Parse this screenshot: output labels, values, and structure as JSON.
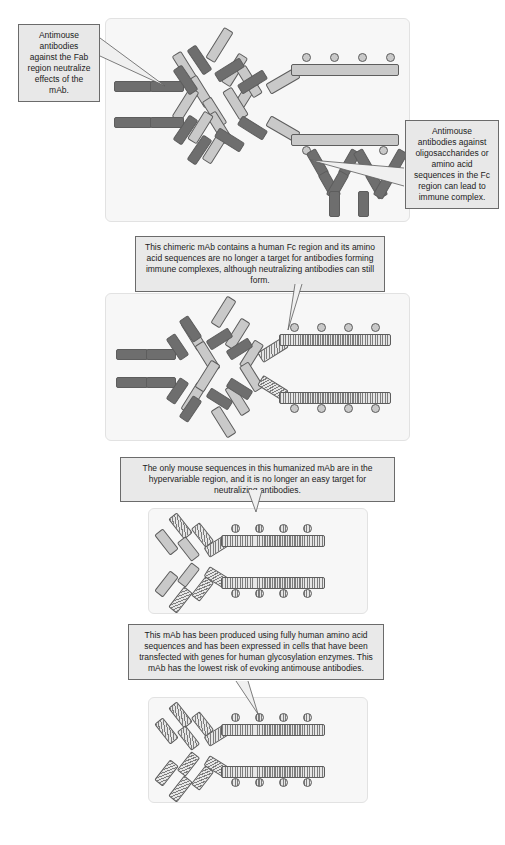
{
  "figure": {
    "kind": "antibody-immunogenicity-diagram",
    "panel_count": 4
  },
  "callouts": [
    {
      "id": "fab-neutralize",
      "text": "Antimouse antibodies against the Fab region neutralize effects of the mAb.",
      "target": "murine mAb Fab arm"
    },
    {
      "id": "fc-immune-complex",
      "text": "Antimouse antibodies against oligosaccharides or amino acid sequences in the Fc region can lead to immune complex.",
      "target": "murine mAb Fc region"
    },
    {
      "id": "chimeric-note",
      "text": "This chimeric mAb contains a human Fc region and its amino acid sequences are no longer a target for antibodies forming immune complexes, although neutralizing antibodies can still form.",
      "target": "chimeric mAb human Fc"
    },
    {
      "id": "humanized-note",
      "text": "The only mouse sequences in this humanized mAb are in the hypervariable region, and it is no longer an easy target for neutralizing antibodies.",
      "target": "humanized mAb hypervariable region"
    },
    {
      "id": "fully-human-note",
      "text": "This mAb has been produced using fully human amino acid sequences and has been expressed in cells that have been transfected with genes for human glycosylation enzymes. This mAb has the lowest risk of evoking antimouse antibodies.",
      "target": "fully human mAb"
    }
  ],
  "panels": [
    {
      "id": "panel-murine",
      "antibody_name": "murine-mab",
      "fab_origin": "mouse",
      "fc_origin": "mouse",
      "glycan_count_top": 4,
      "glycan_count_bottom": 2,
      "bound_antibodies": {
        "anti_fab_count": 2,
        "anti_fc_count": 2
      }
    },
    {
      "id": "panel-chimeric",
      "antibody_name": "chimeric-mab",
      "fab_origin": "mouse",
      "fc_origin": "human",
      "glycan_count_top": 4,
      "glycan_count_bottom": 4,
      "bound_antibodies": {
        "anti_fab_count": 2,
        "anti_fc_count": 0
      }
    },
    {
      "id": "panel-humanized",
      "antibody_name": "humanized-mab",
      "fab_origin": "human-with-mouse-hypervariable",
      "fc_origin": "human",
      "glycan_count_top": 4,
      "glycan_count_bottom": 4,
      "bound_antibodies": {
        "anti_fab_count": 0,
        "anti_fc_count": 0
      }
    },
    {
      "id": "panel-fully-human",
      "antibody_name": "fully-human-mab",
      "fab_origin": "human",
      "fc_origin": "human",
      "glycan_count_top": 4,
      "glycan_count_bottom": 4,
      "bound_antibodies": {
        "anti_fab_count": 0,
        "anti_fc_count": 0
      }
    }
  ],
  "colors": {
    "mouse_segment": "#6e6e6e",
    "light_segment": "#c9c9c9",
    "human_segment_base": "#dcdcdc",
    "human_segment_hatch": "#7d7d7d",
    "outline": "#5d5d5d",
    "panel_background": "#f7f7f7",
    "callout_background": "#e8e8e8",
    "callout_border": "#6b6b6b",
    "page_background": "#ffffff"
  }
}
